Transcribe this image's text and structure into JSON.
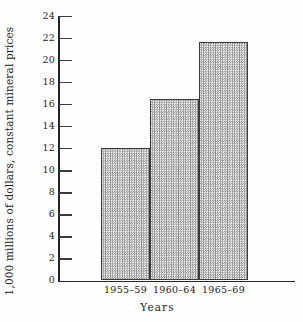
{
  "chart_data": {
    "type": "bar",
    "title": "",
    "subtitle": "",
    "xlabel": "Years",
    "ylabel": "1,000 millions of dollars, constant mineral prices",
    "categories": [
      "1955–59",
      "1960–64",
      "1965–69"
    ],
    "values": [
      12.0,
      16.5,
      21.65
    ],
    "series": [
      {
        "name": "World mineral production value",
        "values": [
          12.0,
          16.5,
          21.65
        ]
      }
    ],
    "ylim": [
      0,
      24
    ],
    "yticks": [
      0,
      2,
      4,
      6,
      8,
      10,
      12,
      14,
      16,
      18,
      20,
      22,
      24
    ],
    "ytick_labels": [
      "0",
      "2",
      "4",
      "6",
      "8",
      "10",
      "12",
      "14",
      "16",
      "18",
      "20",
      "22",
      "24"
    ],
    "grid": false,
    "legend": null,
    "legend_position": "none",
    "tick_direction": "in",
    "bar_style": {
      "fill_pattern": "fine-checkerboard-halftone",
      "fill_color": "#f2f2f0",
      "pattern_color": "#8a8a8a",
      "edge_color": "#3b3b3b",
      "contiguous": true
    },
    "axis_color": "#262626",
    "background_color": "#fefefe",
    "annotations": []
  }
}
